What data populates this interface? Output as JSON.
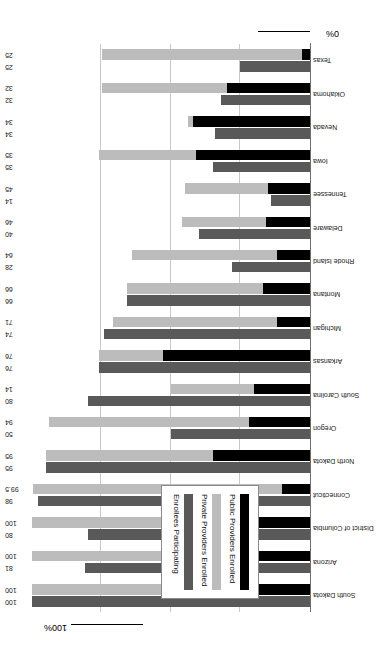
{
  "chart_data": {
    "type": "bar",
    "orientation": "horizontal",
    "stacked": true,
    "title": "",
    "xlabel": "",
    "ylabel": "",
    "xlim": [
      0,
      100
    ],
    "grid": true,
    "gridlines": [
      25,
      50,
      75
    ],
    "axis_min_label": "0%",
    "axis_max_label": "100%",
    "legend_position": "upper-left-inset",
    "legend": [
      {
        "label": "Public Providers Enrolled",
        "color": "#000000"
      },
      {
        "label": "Private Providers Enrolled",
        "color": "#bcbcbc"
      },
      {
        "label": "Enrollees Participating",
        "color": "#595959"
      }
    ],
    "categories": [
      "South Dakota",
      "Arizona",
      "District of Columbia",
      "Connecticut",
      "North Dakota",
      "Oregon",
      "South Carolina",
      "Arkansas",
      "Michigan",
      "Montana",
      "Rhode Island",
      "Delaware",
      "Tennessee",
      "Iowa",
      "Nevada",
      "Oklahoma",
      "Texas"
    ],
    "series": [
      {
        "name": "Providers Enrolled",
        "note": "stacked: public (black) + private (light gray)",
        "public": [
          38,
          26,
          53,
          10,
          35,
          22,
          20,
          53,
          12,
          17,
          12,
          16,
          15,
          41,
          42,
          30,
          3
        ],
        "private": [
          62,
          74,
          47,
          89.5,
          60,
          72,
          30,
          23,
          59,
          49,
          52,
          30,
          31,
          35,
          2,
          45,
          72
        ],
        "total": [
          100,
          100,
          100,
          99.5,
          95,
          94,
          50,
          76,
          71,
          66,
          64,
          46,
          45,
          76,
          44,
          75,
          75
        ]
      },
      {
        "name": "Enrollees Participating",
        "values": [
          100,
          81,
          80,
          98,
          95,
          50,
          80,
          76,
          74,
          66,
          28,
          40,
          14,
          35,
          34,
          32,
          25
        ]
      }
    ],
    "value_labels_pairs": [
      {
        "category": "South Dakota",
        "enrollees": "100",
        "providers": "100"
      },
      {
        "category": "Arizona",
        "enrollees": "81",
        "providers": "100"
      },
      {
        "category": "District of Columbia",
        "enrollees": "80",
        "providers": "100"
      },
      {
        "category": "Connecticut",
        "enrollees": "98",
        "providers": "99.5"
      },
      {
        "category": "North Dakota",
        "enrollees": "95",
        "providers": "95"
      },
      {
        "category": "Oregon",
        "enrollees": "50",
        "providers": "94"
      },
      {
        "category": "South Carolina",
        "enrollees": "80",
        "providers": "14"
      },
      {
        "category": "Arkansas",
        "enrollees": "76",
        "providers": "76"
      },
      {
        "category": "Michigan",
        "enrollees": "74",
        "providers": "71"
      },
      {
        "category": "Montana",
        "enrollees": "66",
        "providers": "66"
      },
      {
        "category": "Rhode Island",
        "enrollees": "28",
        "providers": "64"
      },
      {
        "category": "Delaware",
        "enrollees": "40",
        "providers": "46"
      },
      {
        "category": "Tennessee",
        "enrollees": "14",
        "providers": "45"
      },
      {
        "category": "Iowa",
        "enrollees": "35",
        "providers": "35"
      },
      {
        "category": "Nevada",
        "enrollees": "34",
        "providers": "34"
      },
      {
        "category": "Oklahoma",
        "enrollees": "32",
        "providers": "32"
      },
      {
        "category": "Texas",
        "enrollees": "25",
        "providers": "25"
      }
    ]
  },
  "axis": {
    "left_cap": "0%",
    "right_cap": "100%"
  }
}
